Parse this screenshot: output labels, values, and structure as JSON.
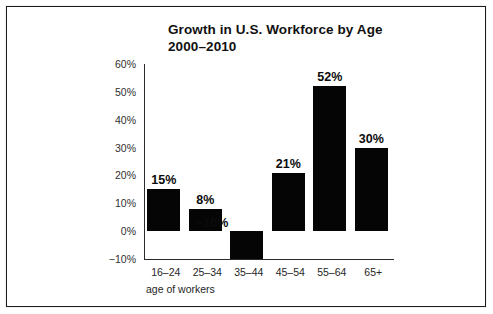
{
  "figure": {
    "background_color": "#ffffff",
    "border_color": "#1c1c1c",
    "bar_color": "#050505",
    "axis_color": "#2b2b2b",
    "text_color": "#111111"
  },
  "chart_data": {
    "type": "bar",
    "title": "Growth in U.S. Workforce by Age",
    "subtitle": "2000–2010",
    "xlabel": "age of workers",
    "ylabel": "",
    "categories": [
      "16–24",
      "25–34",
      "35–44",
      "45–54",
      "55–64",
      "65+"
    ],
    "values": [
      15,
      8,
      -10,
      21,
      52,
      30
    ],
    "value_labels": [
      "15%",
      "8%",
      "−10%",
      "21%",
      "52%",
      "30%"
    ],
    "ylim": [
      -10,
      60
    ],
    "yticks": [
      60,
      50,
      40,
      30,
      20,
      10,
      0,
      -10
    ],
    "ytick_labels": [
      "60%",
      "50%",
      "40%",
      "30%",
      "20%",
      "10%",
      "0%",
      "−10%"
    ],
    "grid": false,
    "legend": false,
    "legend_position": "none",
    "units": "percent"
  }
}
